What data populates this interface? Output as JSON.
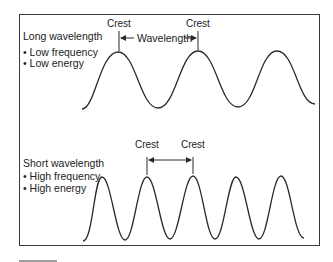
{
  "top_panel": {
    "title": "Long wavelength",
    "bullets": [
      "• Low frequency",
      "• Low energy"
    ],
    "crest_labels": [
      "Crest",
      "Crest"
    ],
    "wavelength_label": "Wavelength"
  },
  "bottom_panel": {
    "title": "Short wavelength",
    "bullets": [
      "• High frequency",
      "• High energy"
    ],
    "crest_labels": [
      "Crest",
      "Crest"
    ]
  },
  "colors": {
    "line": "#2a2a2a",
    "frame": "#3a3a3a",
    "background": "#ffffff"
  }
}
